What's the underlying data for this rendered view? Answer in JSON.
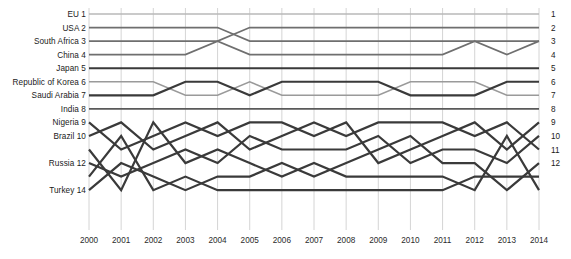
{
  "chart_data": {
    "type": "line",
    "subtype": "bump-chart-ranking",
    "title": "",
    "xlabel": "",
    "ylabel": "",
    "categories": [
      "2000",
      "2001",
      "2002",
      "2003",
      "2004",
      "2005",
      "2006",
      "2007",
      "2008",
      "2009",
      "2010",
      "2011",
      "2012",
      "2013",
      "2014"
    ],
    "x": [
      2000,
      2001,
      2002,
      2003,
      2004,
      2005,
      2006,
      2007,
      2008,
      2009,
      2010,
      2011,
      2012,
      2013,
      2014
    ],
    "ylim": [
      1,
      14
    ],
    "y_inverted": true,
    "grid": true,
    "legend_position": "axis-labels-both-sides",
    "left_axis_ticks": [
      {
        "rank": 1,
        "label": "EU 1"
      },
      {
        "rank": 2,
        "label": "USA 2"
      },
      {
        "rank": 3,
        "label": "South Africa 3"
      },
      {
        "rank": 4,
        "label": "China 4"
      },
      {
        "rank": 5,
        "label": "Japan 5"
      },
      {
        "rank": 6,
        "label": "Republic of Korea 6"
      },
      {
        "rank": 7,
        "label": "Saudi Arabia 7"
      },
      {
        "rank": 8,
        "label": "India 8"
      },
      {
        "rank": 9,
        "label": "Nigeria 9"
      },
      {
        "rank": 10,
        "label": "Brazil 10"
      },
      {
        "rank": 12,
        "label": "Russia 12"
      },
      {
        "rank": 14,
        "label": "Turkey 14"
      }
    ],
    "right_axis_ticks": [
      "1",
      "2",
      "3",
      "4",
      "5",
      "6",
      "7",
      "8",
      "9",
      "10",
      "11",
      "12"
    ],
    "series": [
      {
        "name": "EU",
        "start_rank": 1,
        "color": "#b8b8b8",
        "width": 1.5,
        "values": [
          1,
          1,
          1,
          1,
          1,
          1,
          1,
          1,
          1,
          1,
          1,
          1,
          1,
          1,
          1
        ]
      },
      {
        "name": "USA",
        "start_rank": 2,
        "color": "#6f6f6f",
        "width": 1.7,
        "values": [
          2,
          2,
          2,
          2,
          2,
          3,
          3,
          3,
          3,
          3,
          3,
          3,
          3,
          3,
          3
        ]
      },
      {
        "name": "South Africa",
        "start_rank": 3,
        "color": "#6f6f6f",
        "width": 1.7,
        "values": [
          3,
          3,
          3,
          3,
          3,
          2,
          2,
          2,
          2,
          2,
          2,
          2,
          2,
          2,
          2
        ]
      },
      {
        "name": "China",
        "start_rank": 4,
        "color": "#6f6f6f",
        "width": 1.7,
        "values": [
          4,
          4,
          4,
          4,
          3,
          4,
          4,
          4,
          4,
          4,
          4,
          4,
          3,
          4,
          3
        ]
      },
      {
        "name": "Japan",
        "start_rank": 5,
        "color": "#3a3a3a",
        "width": 2.1,
        "values": [
          5,
          5,
          5,
          5,
          5,
          5,
          5,
          5,
          5,
          5,
          5,
          5,
          5,
          5,
          5
        ]
      },
      {
        "name": "Republic of Korea",
        "start_rank": 6,
        "color": "#9a9a9a",
        "width": 1.6,
        "values": [
          6,
          6,
          6,
          7,
          7,
          6,
          7,
          7,
          7,
          7,
          6,
          6,
          6,
          7,
          7
        ]
      },
      {
        "name": "Saudi Arabia",
        "start_rank": 7,
        "color": "#3a3a3a",
        "width": 2.2,
        "values": [
          7,
          7,
          7,
          6,
          6,
          7,
          6,
          6,
          6,
          6,
          7,
          7,
          7,
          6,
          6
        ]
      },
      {
        "name": "India",
        "start_rank": 8,
        "color": "#5a5a5a",
        "width": 1.8,
        "values": [
          8,
          8,
          8,
          8,
          8,
          8,
          8,
          8,
          8,
          8,
          8,
          8,
          8,
          8,
          8
        ]
      },
      {
        "name": "Nigeria",
        "start_rank": 9,
        "color": "#3a3a3a",
        "width": 2.2,
        "values": [
          9,
          11,
          10,
          9,
          10,
          9,
          9,
          10,
          9,
          12,
          11,
          10,
          9,
          11,
          9
        ]
      },
      {
        "name": "Brazil",
        "start_rank": 10,
        "color": "#3a3a3a",
        "width": 2.2,
        "values": [
          10,
          9,
          11,
          10,
          9,
          11,
          10,
          9,
          10,
          9,
          9,
          9,
          10,
          9,
          11
        ]
      },
      {
        "name": "Russia",
        "start_rank": 12,
        "color": "#3a3a3a",
        "width": 2.2,
        "values": [
          12,
          13,
          12,
          11,
          12,
          10,
          11,
          11,
          11,
          10,
          12,
          11,
          11,
          12,
          10
        ]
      },
      {
        "name": "Turkey",
        "start_rank": 14,
        "color": "#3a3a3a",
        "width": 2.2,
        "values": [
          14,
          12,
          13,
          14,
          13,
          13,
          12,
          13,
          12,
          11,
          10,
          12,
          12,
          14,
          12
        ]
      },
      {
        "name": "Other A",
        "start_rank": 11,
        "color": "#3a3a3a",
        "width": 2.2,
        "values": [
          11,
          14,
          9,
          12,
          11,
          12,
          13,
          12,
          13,
          13,
          13,
          13,
          14,
          10,
          14
        ]
      },
      {
        "name": "Other B",
        "start_rank": 13,
        "color": "#3a3a3a",
        "width": 2.2,
        "values": [
          13,
          10,
          14,
          13,
          14,
          14,
          14,
          14,
          14,
          14,
          14,
          14,
          13,
          13,
          13
        ]
      }
    ]
  },
  "axis": {
    "x_tick_labels": [
      "2000",
      "2001",
      "2002",
      "2003",
      "2004",
      "2005",
      "2006",
      "2007",
      "2008",
      "2009",
      "2010",
      "2011",
      "2012",
      "2013",
      "2014"
    ]
  }
}
